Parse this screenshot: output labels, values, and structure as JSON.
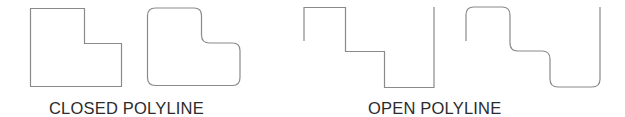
{
  "diagram": {
    "stroke_color": "#8a8a8a",
    "groups": [
      {
        "id": "closed",
        "caption": "CLOSED POLYLINE",
        "shapes": [
          {
            "name": "closed-polyline-sharp",
            "style": "sharp corners",
            "closed": true
          },
          {
            "name": "closed-polyline-rounded",
            "style": "filleted corners",
            "closed": true
          }
        ]
      },
      {
        "id": "open",
        "caption": "OPEN POLYLINE",
        "shapes": [
          {
            "name": "open-polyline-sharp",
            "style": "sharp corners",
            "closed": false
          },
          {
            "name": "open-polyline-rounded",
            "style": "filleted corners",
            "closed": false
          }
        ]
      }
    ]
  }
}
